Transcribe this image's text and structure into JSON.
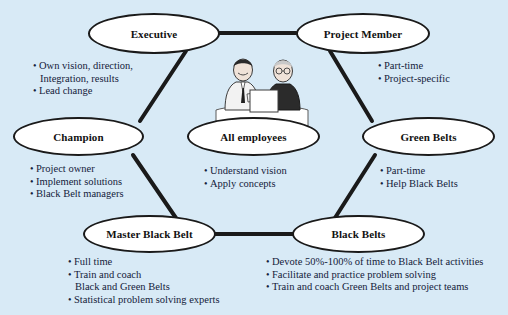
{
  "diagram": {
    "background_color": "#d8eaf6",
    "node_fill": "#ffffff",
    "node_stroke": "#1a1a1a",
    "text_color": "#14213a",
    "type": "hexagonal node-link diagram"
  },
  "nodes": [
    {
      "id": "executive",
      "label": "Executive"
    },
    {
      "id": "project-member",
      "label": "Project Member"
    },
    {
      "id": "champion",
      "label": "Champion"
    },
    {
      "id": "all-employees",
      "label": "All employees"
    },
    {
      "id": "green-belts",
      "label": "Green Belts"
    },
    {
      "id": "master-black-belt",
      "label": "Master Black Belt"
    },
    {
      "id": "black-belts",
      "label": "Black Belts"
    }
  ],
  "annotations": {
    "executive": [
      {
        "text": "Own vision, direction,",
        "continuation": false
      },
      {
        "text": "Integration, results",
        "continuation": true
      },
      {
        "text": "Lead change",
        "continuation": false
      }
    ],
    "project_member": [
      {
        "text": "Part-time",
        "continuation": false
      },
      {
        "text": "Project-specific",
        "continuation": false
      }
    ],
    "champion": [
      {
        "text": "Project owner",
        "continuation": false
      },
      {
        "text": "Implement solutions",
        "continuation": false
      },
      {
        "text": "Black Belt managers",
        "continuation": false
      }
    ],
    "all_employees": [
      {
        "text": "Understand vision",
        "continuation": false
      },
      {
        "text": "Apply concepts",
        "continuation": false
      }
    ],
    "green_belts": [
      {
        "text": "Part-time",
        "continuation": false
      },
      {
        "text": "Help Black Belts",
        "continuation": false
      }
    ],
    "master_black_belt": [
      {
        "text": "Full time",
        "continuation": false
      },
      {
        "text": "Train and coach",
        "continuation": false
      },
      {
        "text": "Black and Green Belts",
        "continuation": true
      },
      {
        "text": "Statistical problem solving experts",
        "continuation": false
      }
    ],
    "black_belts": [
      {
        "text": "Devote 50%-100% of time to Black Belt activities",
        "continuation": false
      },
      {
        "text": "Facilitate and practice problem solving",
        "continuation": false
      },
      {
        "text": "Train and coach Green Belts and project teams",
        "continuation": false
      }
    ]
  },
  "illustration": {
    "name": "two-people-reviewing-document-illustration",
    "description": "Two colleagues standing at a table reviewing a document together"
  },
  "edges": [
    {
      "from": "executive",
      "to": "project-member"
    },
    {
      "from": "executive",
      "to": "champion"
    },
    {
      "from": "project-member",
      "to": "green-belts"
    },
    {
      "from": "champion",
      "to": "master-black-belt"
    },
    {
      "from": "green-belts",
      "to": "black-belts"
    },
    {
      "from": "master-black-belt",
      "to": "black-belts"
    }
  ]
}
